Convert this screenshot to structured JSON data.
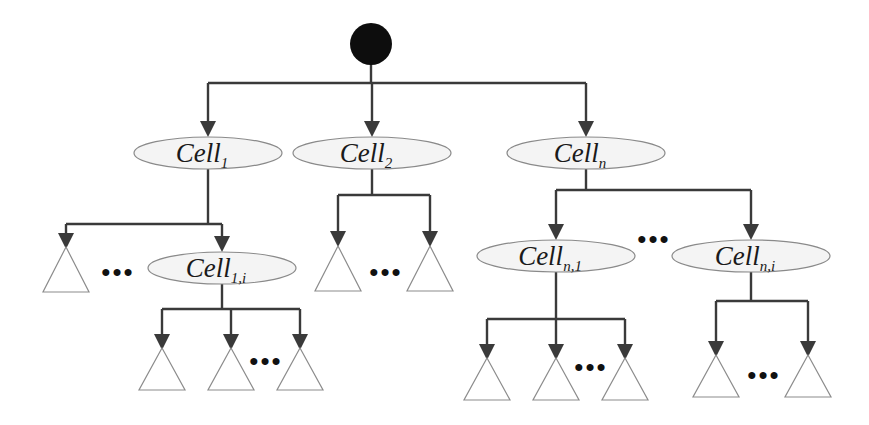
{
  "diagram": {
    "type": "tree",
    "title": "",
    "root": {
      "label": "",
      "shape": "filled-circle",
      "color": "#0d0d0d"
    },
    "nodes": [
      {
        "id": "cell_1",
        "base": "Cell",
        "sub": "1",
        "parent": "root"
      },
      {
        "id": "cell_2",
        "base": "Cell",
        "sub": "2",
        "parent": "root"
      },
      {
        "id": "cell_n",
        "base": "Cell",
        "sub": "n",
        "parent": "root"
      },
      {
        "id": "cell_1_i",
        "base": "Cell",
        "sub": "1,i",
        "parent": "cell_1"
      },
      {
        "id": "cell_n_1",
        "base": "Cell",
        "sub": "n,1",
        "parent": "cell_n"
      },
      {
        "id": "cell_n_i",
        "base": "Cell",
        "sub": "n,i",
        "parent": "cell_n"
      }
    ],
    "leaf_groups": [
      {
        "parent": "cell_1",
        "leaf_count": 1,
        "ellipsis": true
      },
      {
        "parent": "cell_2",
        "leaf_count": 2,
        "ellipsis": true
      },
      {
        "parent": "cell_1_i",
        "leaf_count": 3,
        "ellipsis": true
      },
      {
        "parent": "cell_n_1",
        "leaf_count": 3,
        "ellipsis": true
      },
      {
        "parent": "cell_n_i",
        "leaf_count": 2,
        "ellipsis": true
      }
    ],
    "ellipsis_text": "•••",
    "colors": {
      "edge": "#3a3a3a",
      "node_fill": "#f4f4f4",
      "node_stroke": "#8a8a8a",
      "leaf_stroke": "#8c8c8c"
    }
  }
}
